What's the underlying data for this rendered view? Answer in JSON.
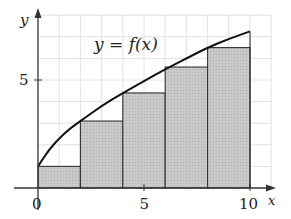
{
  "chart_data": {
    "type": "bar",
    "subtype": "riemann-sum-left-endpoints",
    "title": "",
    "function_label": "y = f(x)",
    "xlabel": "x",
    "ylabel": "y",
    "xlim": [
      0,
      11
    ],
    "ylim": [
      0,
      8
    ],
    "grid": true,
    "x_ticks": [
      {
        "value": 0,
        "label": "0"
      },
      {
        "value": 5,
        "label": "5"
      },
      {
        "value": 10,
        "label": "10"
      }
    ],
    "y_ticks": [
      {
        "value": 5,
        "label": "5"
      }
    ],
    "n_rectangles": 5,
    "interval": [
      0,
      10
    ],
    "categories": [
      "[0,2]",
      "[2,4]",
      "[4,6]",
      "[6,8]",
      "[8,10]"
    ],
    "rectangles": [
      {
        "x0": 0,
        "x1": 2,
        "height": 1.0
      },
      {
        "x0": 2,
        "x1": 4,
        "height": 3.1
      },
      {
        "x0": 4,
        "x1": 6,
        "height": 4.4
      },
      {
        "x0": 6,
        "x1": 8,
        "height": 5.6
      },
      {
        "x0": 8,
        "x1": 10,
        "height": 6.5
      }
    ],
    "values": [
      1.0,
      3.1,
      4.4,
      5.6,
      6.5
    ],
    "curve_points": [
      [
        0,
        1.0
      ],
      [
        0.5,
        1.75
      ],
      [
        1,
        2.3
      ],
      [
        1.5,
        2.75
      ],
      [
        2,
        3.1
      ],
      [
        3,
        3.8
      ],
      [
        4,
        4.4
      ],
      [
        5,
        4.95
      ],
      [
        6,
        5.5
      ],
      [
        7,
        6.0
      ],
      [
        8,
        6.5
      ],
      [
        9,
        6.9
      ],
      [
        10,
        7.25
      ]
    ],
    "colors": {
      "rect_fill": "#c4c4c4",
      "rect_stroke": "#333333",
      "curve": "#111111",
      "grid": "#e2e2e2",
      "axis": "#333333"
    }
  }
}
